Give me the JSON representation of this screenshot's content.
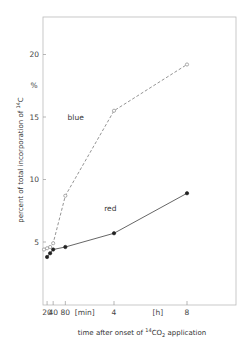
{
  "chart_data": {
    "type": "line",
    "title": "",
    "xlabel": "time after onset of 14CO2 application",
    "xlabel_parts": {
      "pre": "time after onset of ",
      "sup": "14",
      "mid": "CO",
      "sub": "2",
      "post": " application"
    },
    "ylabel": "percent of total incorporation of 14C",
    "ylabel_parts": {
      "pre": "percent of total incorporation of ",
      "sup": "14",
      "post": "C"
    },
    "y_unit": "%",
    "ylim": [
      0,
      23
    ],
    "yticks": [
      5,
      10,
      15,
      20
    ],
    "x_unit_hours": true,
    "xticks": [
      {
        "hours": 0.3333,
        "label": "20"
      },
      {
        "hours": 0.6667,
        "label": "40"
      },
      {
        "hours": 1.3333,
        "label": "80"
      },
      {
        "hours": 4,
        "label": "4"
      },
      {
        "hours": 8,
        "label": "8"
      }
    ],
    "x_unit_labels": [
      {
        "hours": 2.4,
        "label": "[min]"
      },
      {
        "hours": 6.4,
        "label": "[h]"
      }
    ],
    "xlim_hours": [
      0,
      10.6
    ],
    "grid": false,
    "legend": "inline labels",
    "series": [
      {
        "name": "blue",
        "style": "dashed",
        "marker": "open-circle",
        "x_hours": [
          0.1667,
          0.3333,
          0.5,
          0.6667,
          1.3333,
          4,
          8
        ],
        "values": [
          4.4,
          4.5,
          4.6,
          4.9,
          8.7,
          15.5,
          19.2
        ],
        "label_pos": {
          "hours": 1.9,
          "value": 14.8
        }
      },
      {
        "name": "red",
        "style": "solid",
        "marker": "filled-circle",
        "x_hours": [
          0.3333,
          0.5,
          0.6667,
          1.3333,
          4,
          8
        ],
        "values": [
          3.8,
          4.1,
          4.4,
          4.6,
          5.7,
          8.9
        ],
        "label_pos": {
          "hours": 3.8,
          "value": 7.5
        }
      }
    ]
  }
}
